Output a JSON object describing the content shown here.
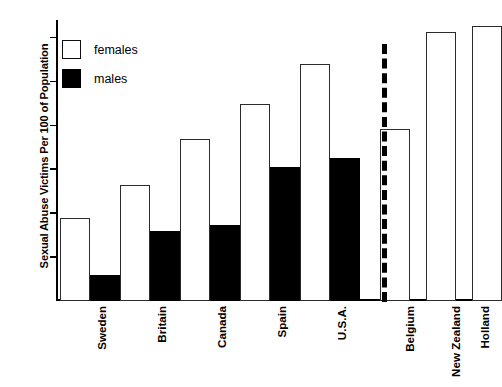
{
  "chart_data": {
    "type": "bar",
    "title": "",
    "xlabel": "",
    "ylabel": "Sexual Abuse Victims Per 100 of Population",
    "ylim": [
      0,
      32
    ],
    "yticks": [
      5,
      10,
      15,
      20,
      25,
      30
    ],
    "grid": false,
    "legend_position": "top-left",
    "categories": [
      "Sweden",
      "Britain",
      "Canada",
      "Spain",
      "U.S.A.",
      "Belgium",
      "New Zealand",
      "Holland"
    ],
    "series": [
      {
        "name": "females",
        "color": "#ffffff",
        "values": [
          9.5,
          13.2,
          18.4,
          22.4,
          27.0,
          19.6,
          30.6,
          31.3
        ]
      },
      {
        "name": "males",
        "color": "#000000",
        "values": [
          3.0,
          8.0,
          8.7,
          15.3,
          16.3,
          null,
          null,
          null
        ]
      }
    ],
    "annotations": [
      {
        "name": "dashed-divider",
        "type": "vertical-dashed-line",
        "after_category": "U.S.A."
      }
    ]
  },
  "legend": {
    "items": [
      {
        "label": "females",
        "swatch": "open-square-icon"
      },
      {
        "label": "males",
        "swatch": "filled-square-icon"
      }
    ]
  },
  "axis": {
    "y_title": "Sexual Abuse Victims Per 100 of Population",
    "y_tick_labels": [
      "30",
      "25",
      "20",
      "15",
      "10",
      "5"
    ]
  }
}
